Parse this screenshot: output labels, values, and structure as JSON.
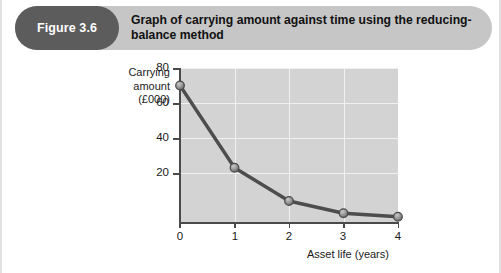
{
  "figure": {
    "badge_label": "Figure 3.6",
    "title": "Graph of carrying amount against time using the reducing-balance method"
  },
  "colors": {
    "badge_background": "#5c5c5c",
    "header_background": "#c6c6c6",
    "plot_background": "#d3d3d3",
    "gridline": "#f0f0f0",
    "axis": "#4a4a4a",
    "series_line": "#4d4d4d",
    "marker_fill": "#9a9a9a",
    "page_background": "#ffffff"
  },
  "chart_data": {
    "type": "line",
    "title": "Graph of carrying amount against time using the reducing-balance method",
    "xlabel": "Asset life (years)",
    "ylabel": "Carrying amount (£000)",
    "ylabel_lines": [
      "Carrying",
      "amount",
      "(£000)"
    ],
    "x": [
      0,
      1,
      2,
      3,
      4
    ],
    "values": [
      78,
      31,
      12,
      5,
      3
    ],
    "series": [
      {
        "name": "Carrying amount",
        "values": [
          78,
          31,
          12,
          5,
          3
        ]
      }
    ],
    "xlim": [
      0,
      4
    ],
    "ylim": [
      0,
      88
    ],
    "xticks": [
      "0",
      "1",
      "2",
      "3",
      "4"
    ],
    "yticks": [
      "20",
      "40",
      "60",
      "80"
    ],
    "ytick_values": [
      20,
      40,
      60,
      80
    ],
    "grid": true,
    "legend": null,
    "markers": "circle"
  }
}
